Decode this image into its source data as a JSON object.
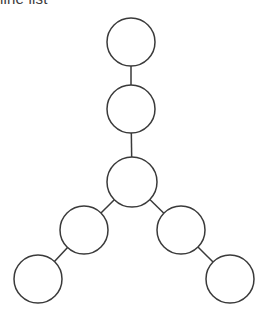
{
  "canvas": {
    "width": 273,
    "height": 322,
    "background_color": "#ffffff"
  },
  "caption": {
    "text": "line list",
    "color": "#3c3c3c",
    "clipped_at_top": true
  },
  "diagram": {
    "kind": "node-link-tree",
    "node_shape": "circle",
    "node_fill_color": "#ffffff",
    "node_stroke_color": "#3a3a3a",
    "node_stroke_width": 1.5,
    "edge_stroke_color": "#3a3a3a",
    "edge_stroke_width": 1.5,
    "node_radius": 24,
    "node_count": 7,
    "edge_count": 6,
    "nodes": [
      {
        "id": "n1",
        "label": "",
        "cx": 131,
        "cy": 42,
        "r": 24,
        "role": "root"
      },
      {
        "id": "n2",
        "label": "",
        "cx": 131,
        "cy": 109,
        "r": 24,
        "role": "chain"
      },
      {
        "id": "n3",
        "label": "",
        "cx": 132,
        "cy": 182,
        "r": 25,
        "role": "branch-point"
      },
      {
        "id": "n4",
        "label": "",
        "cx": 84,
        "cy": 230,
        "r": 24,
        "role": "left-branch"
      },
      {
        "id": "n5",
        "label": "",
        "cx": 38,
        "cy": 279,
        "r": 24,
        "role": "left-leaf"
      },
      {
        "id": "n6",
        "label": "",
        "cx": 181,
        "cy": 230,
        "r": 24,
        "role": "right-branch"
      },
      {
        "id": "n7",
        "label": "",
        "cx": 230,
        "cy": 279,
        "r": 24,
        "role": "right-leaf"
      }
    ],
    "edges": [
      {
        "id": "e1",
        "from": "n1",
        "to": "n2",
        "orientation": "vertical"
      },
      {
        "id": "e2",
        "from": "n2",
        "to": "n3",
        "orientation": "vertical"
      },
      {
        "id": "e3",
        "from": "n3",
        "to": "n4",
        "orientation": "diagonal-down-left"
      },
      {
        "id": "e4",
        "from": "n4",
        "to": "n5",
        "orientation": "diagonal-down-left"
      },
      {
        "id": "e5",
        "from": "n3",
        "to": "n6",
        "orientation": "diagonal-down-right"
      },
      {
        "id": "e6",
        "from": "n6",
        "to": "n7",
        "orientation": "diagonal-down-right"
      }
    ]
  }
}
